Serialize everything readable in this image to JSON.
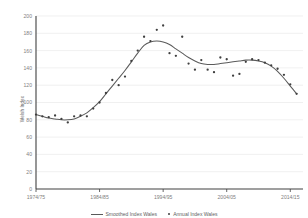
{
  "chart_data": {
    "type": "scatter",
    "title": "",
    "xlabel": "",
    "ylabel": "Welsh Index",
    "ylim": [
      0,
      200
    ],
    "ytick_labels": [
      "0",
      "20",
      "40",
      "60",
      "80",
      "100",
      "120",
      "140",
      "160",
      "180",
      "200"
    ],
    "ytick_values": [
      0,
      20,
      40,
      60,
      80,
      100,
      120,
      140,
      160,
      180,
      200
    ],
    "xtick_labels": [
      "1974/75",
      "1984/85",
      "1994/95",
      "2004/05",
      "2014/15"
    ],
    "xtick_values": [
      1974,
      1984,
      1994,
      2004,
      2014
    ],
    "xlim": [
      1974,
      2016
    ],
    "grid": true,
    "legend_position": "bottom",
    "series": [
      {
        "name": "Annual Index Wales",
        "marker": "dot",
        "color": "#3f3f3f",
        "x": [
          1974,
          1975,
          1976,
          1977,
          1978,
          1979,
          1980,
          1981,
          1982,
          1983,
          1984,
          1985,
          1986,
          1987,
          1988,
          1989,
          1990,
          1991,
          1992,
          1993,
          1994,
          1995,
          1996,
          1997,
          1998,
          1999,
          2000,
          2001,
          2002,
          2003,
          2004,
          2005,
          2006,
          2007,
          2008,
          2009,
          2010,
          2011,
          2012,
          2013,
          2014,
          2015
        ],
        "values": [
          86,
          84,
          83,
          85,
          81,
          77,
          84,
          85,
          84,
          93,
          100,
          111,
          126,
          120,
          130,
          148,
          160,
          176,
          171,
          184,
          189,
          157,
          154,
          176,
          145,
          138,
          149,
          138,
          135,
          152,
          150,
          131,
          133,
          147,
          150,
          149,
          146,
          143,
          139,
          132,
          121,
          110
        ]
      },
      {
        "name": "Smoothed Index Wales",
        "marker": "line",
        "color": "#5a5a5a",
        "x": [
          1974,
          1975,
          1976,
          1977,
          1978,
          1979,
          1980,
          1981,
          1982,
          1983,
          1984,
          1985,
          1986,
          1987,
          1988,
          1989,
          1990,
          1991,
          1992,
          1993,
          1994,
          1995,
          1996,
          1997,
          1998,
          1999,
          2000,
          2001,
          2002,
          2003,
          2004,
          2005,
          2006,
          2007,
          2008,
          2009,
          2010,
          2011,
          2012,
          2013,
          2014,
          2015
        ],
        "values": [
          86,
          84,
          82,
          81,
          80,
          80,
          81,
          84,
          88,
          94,
          101,
          110,
          119,
          128,
          137,
          147,
          157,
          166,
          170,
          171,
          170,
          167,
          162,
          157,
          152,
          148,
          145,
          144,
          144,
          145,
          146,
          147,
          148,
          149,
          149,
          148,
          146,
          142,
          136,
          128,
          119,
          110
        ]
      }
    ]
  },
  "legend": {
    "smoothed_label": "Smoothed Index Wales",
    "annual_label": "Annual Index Wales"
  },
  "axes": {
    "y_title": "Welsh Index"
  }
}
